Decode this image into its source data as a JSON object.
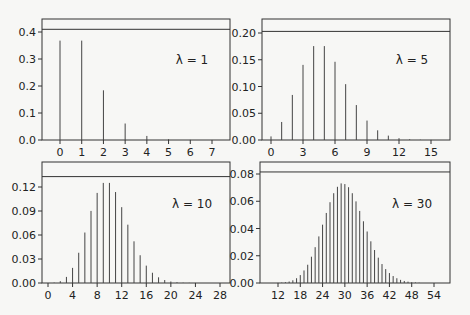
{
  "figure": {
    "width": 470,
    "height": 315,
    "background": "#f7f7f5",
    "line_color": "#333333",
    "bar_color": "#444444"
  },
  "chart_data": [
    {
      "type": "bar",
      "title": "",
      "annotation": "λ = 1",
      "xlabel": "",
      "ylabel": "",
      "xticks": [
        0,
        1,
        2,
        3,
        4,
        5,
        6,
        7
      ],
      "yticks": [
        0.0,
        0.1,
        0.2,
        0.3,
        0.4
      ],
      "ytick_labels": [
        "0.0",
        "0.1",
        "0.2",
        "0.3",
        "0.4"
      ],
      "xlim": [
        -0.9,
        7.8
      ],
      "ylim": [
        0,
        0.46
      ],
      "reference_line_y": 0.41,
      "x": [
        0,
        1,
        2,
        3,
        4,
        5,
        6,
        7
      ],
      "values": [
        0.368,
        0.368,
        0.184,
        0.061,
        0.015,
        0.003,
        0.0005,
        0.0001
      ],
      "layout": {
        "left": 42,
        "right": 230,
        "top": 19,
        "bottom": 140,
        "x0px": 60,
        "x1px": 212,
        "xval0": 0,
        "xval1": 7,
        "y0px": 140,
        "y1px": 32,
        "yval1": 0.4,
        "label_x": 192,
        "label_y": 64
      }
    },
    {
      "type": "bar",
      "title": "",
      "annotation": "λ = 5",
      "xlabel": "",
      "ylabel": "",
      "xticks": [
        0,
        3,
        6,
        9,
        12,
        15
      ],
      "yticks": [
        0.0,
        0.05,
        0.1,
        0.15,
        0.2
      ],
      "ytick_labels": [
        "0.00",
        "0.05",
        "0.10",
        "0.15",
        "0.20"
      ],
      "xlim": [
        -1.5,
        17
      ],
      "ylim": [
        0,
        0.225
      ],
      "reference_line_y": 0.203,
      "x": [
        0,
        1,
        2,
        3,
        4,
        5,
        6,
        7,
        8,
        9,
        10,
        11,
        12,
        13,
        14,
        15
      ],
      "values": [
        0.0067,
        0.0337,
        0.0842,
        0.1404,
        0.1755,
        0.1755,
        0.1462,
        0.1044,
        0.0653,
        0.0363,
        0.0181,
        0.0082,
        0.0034,
        0.0013,
        0.0005,
        0.0002
      ],
      "layout": {
        "left": 262,
        "right": 450,
        "top": 19,
        "bottom": 140,
        "x0px": 271,
        "x1px": 431,
        "xval0": 0,
        "xval1": 15,
        "y0px": 140,
        "y1px": 33,
        "yval1": 0.2,
        "label_x": 412,
        "label_y": 64
      }
    },
    {
      "type": "bar",
      "title": "",
      "annotation": "λ = 10",
      "xlabel": "",
      "ylabel": "",
      "xticks": [
        0,
        4,
        8,
        12,
        16,
        20,
        24,
        28
      ],
      "yticks": [
        0.0,
        0.03,
        0.06,
        0.09,
        0.12
      ],
      "ytick_labels": [
        "0.00",
        "0.03",
        "0.06",
        "0.09",
        "0.12"
      ],
      "xlim": [
        -3,
        30
      ],
      "ylim": [
        0,
        0.14
      ],
      "reference_line_y": 0.133,
      "x": [
        0,
        1,
        2,
        3,
        4,
        5,
        6,
        7,
        8,
        9,
        10,
        11,
        12,
        13,
        14,
        15,
        16,
        17,
        18,
        19,
        20,
        21,
        22,
        23,
        24
      ],
      "values": [
        0.0,
        0.0005,
        0.0023,
        0.0076,
        0.0189,
        0.0378,
        0.0631,
        0.0901,
        0.1126,
        0.1251,
        0.1251,
        0.1137,
        0.0948,
        0.0729,
        0.0521,
        0.0347,
        0.0217,
        0.0128,
        0.0071,
        0.0037,
        0.0019,
        0.0009,
        0.0004,
        0.0002,
        0.0001
      ],
      "layout": {
        "left": 42,
        "right": 230,
        "top": 162,
        "bottom": 283,
        "x0px": 48,
        "x1px": 220,
        "xval0": 0,
        "xval1": 28,
        "y0px": 283,
        "y1px": 187,
        "yval1": 0.12,
        "label_x": 192,
        "label_y": 208
      }
    },
    {
      "type": "bar",
      "title": "",
      "annotation": "λ = 30",
      "xlabel": "",
      "ylabel": "",
      "xticks": [
        12,
        18,
        24,
        30,
        36,
        42,
        48,
        54
      ],
      "yticks": [
        0.0,
        0.02,
        0.04,
        0.06,
        0.08
      ],
      "ytick_labels": [
        "0.00",
        "0.02",
        "0.04",
        "0.06",
        "0.08"
      ],
      "xlim": [
        8,
        58
      ],
      "ylim": [
        0,
        0.086
      ],
      "reference_line_y": 0.0815,
      "x": [
        12,
        13,
        14,
        15,
        16,
        17,
        18,
        19,
        20,
        21,
        22,
        23,
        24,
        25,
        26,
        27,
        28,
        29,
        30,
        31,
        32,
        33,
        34,
        35,
        36,
        37,
        38,
        39,
        40,
        41,
        42,
        43,
        44,
        45,
        46,
        47,
        48,
        49,
        50
      ],
      "values": [
        0.0001,
        0.0003,
        0.0006,
        0.0011,
        0.002,
        0.0035,
        0.0058,
        0.0092,
        0.0134,
        0.0193,
        0.0263,
        0.0342,
        0.0428,
        0.0514,
        0.0593,
        0.0659,
        0.0706,
        0.0731,
        0.0726,
        0.0703,
        0.0659,
        0.0599,
        0.0529,
        0.0453,
        0.0378,
        0.0306,
        0.0242,
        0.0186,
        0.0139,
        0.0102,
        0.0073,
        0.0051,
        0.0035,
        0.0023,
        0.0015,
        0.001,
        0.0006,
        0.0004,
        0.0002
      ],
      "layout": {
        "left": 260,
        "right": 450,
        "top": 162,
        "bottom": 283,
        "x0px": 278,
        "x1px": 434,
        "xval0": 12,
        "xval1": 54,
        "y0px": 283,
        "y1px": 174,
        "yval1": 0.08,
        "label_x": 412,
        "label_y": 208
      }
    }
  ]
}
